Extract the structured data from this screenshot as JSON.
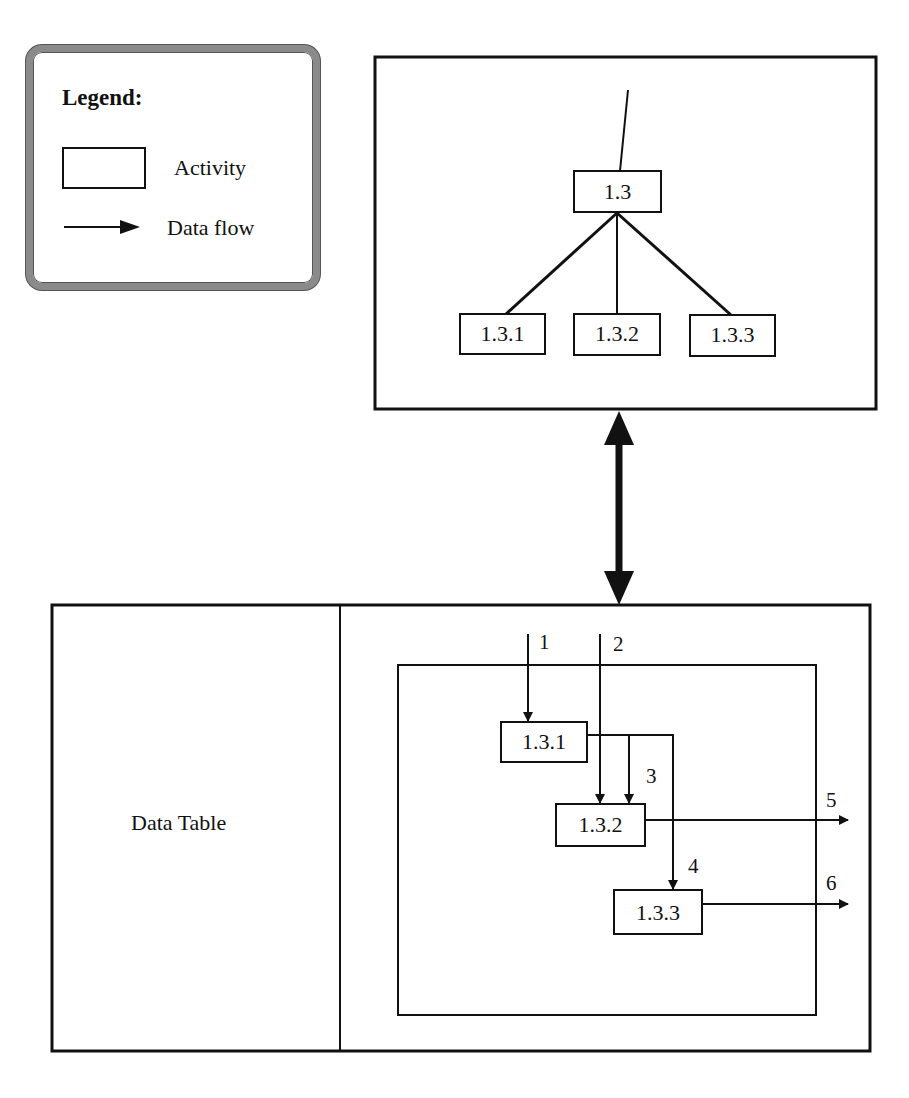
{
  "legend": {
    "title": "Legend:",
    "items": [
      {
        "symbol": "rectangle",
        "label": "Activity"
      },
      {
        "symbol": "arrow",
        "label": "Data flow"
      }
    ]
  },
  "hierarchy": {
    "parent": "1.3",
    "children": [
      "1.3.1",
      "1.3.2",
      "1.3.3"
    ]
  },
  "connector": {
    "type": "bidirectional-arrow"
  },
  "data_table": {
    "label": "Data Table"
  },
  "flow": {
    "activities": [
      "1.3.1",
      "1.3.2",
      "1.3.3"
    ],
    "flows": [
      {
        "id": "1",
        "from": "external",
        "to": "1.3.1"
      },
      {
        "id": "2",
        "from": "external",
        "to": "1.3.2"
      },
      {
        "id": "3",
        "from": "1.3.1",
        "to": "1.3.2"
      },
      {
        "id": "4",
        "from": "1.3.1",
        "to": "1.3.3"
      },
      {
        "id": "5",
        "from": "1.3.2",
        "to": "external"
      },
      {
        "id": "6",
        "from": "1.3.3",
        "to": "external"
      }
    ]
  },
  "colors": {
    "ink": "#111111",
    "legend_border": "#8a8a8a",
    "background": "#ffffff"
  }
}
